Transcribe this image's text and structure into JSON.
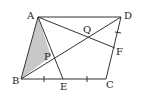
{
  "figure": {
    "type": "parallelogram-geometry",
    "colors": {
      "line": "#333333",
      "shade": "#c8c8c8",
      "background": "#ffffff"
    },
    "points": {
      "A": {
        "label": "A",
        "x": 38,
        "y": 17
      },
      "D": {
        "label": "D",
        "x": 121,
        "y": 17
      },
      "B": {
        "label": "B",
        "x": 21,
        "y": 79
      },
      "C": {
        "label": "C",
        "x": 106,
        "y": 79
      },
      "E": {
        "label": "E",
        "x": 63,
        "y": 79
      },
      "F": {
        "label": "F",
        "x": 115,
        "y": 48
      },
      "P": {
        "label": "P",
        "x": 51,
        "y": 56
      },
      "Q": {
        "label": "Q",
        "x": 87,
        "y": 37
      }
    },
    "shaded_region": [
      "A",
      "B",
      "P"
    ],
    "segments": [
      [
        "A",
        "D"
      ],
      [
        "D",
        "C"
      ],
      [
        "C",
        "B"
      ],
      [
        "B",
        "A"
      ],
      [
        "B",
        "D"
      ],
      [
        "A",
        "E"
      ],
      [
        "A",
        "F"
      ]
    ],
    "tick_marks": [
      "BE",
      "EC",
      "DF"
    ]
  }
}
